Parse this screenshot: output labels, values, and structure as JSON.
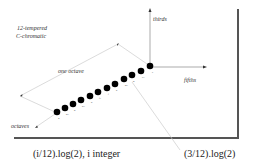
{
  "title": {
    "line1": "12-tempered",
    "line2": "C-chromatic"
  },
  "axes": {
    "vertical": "thirds",
    "horizontal": "fifths"
  },
  "annotations": {
    "one_octave": "one octave",
    "octaves": "octaves"
  },
  "captions": {
    "left": "(i/12).log(2), i integer",
    "right": "(3/12).log(2)"
  },
  "notes": [
    "b",
    "a#",
    "a",
    "g#",
    "g",
    "f#",
    "f",
    "e",
    "d#",
    "d",
    "c#",
    "c"
  ],
  "colors": {
    "dot": "#000000",
    "line": "#bbbbbb",
    "frame": "#555555",
    "text": "#222222"
  }
}
